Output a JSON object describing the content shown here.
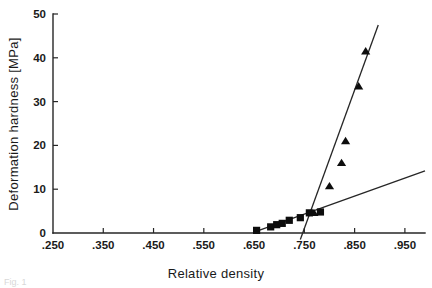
{
  "chart_data": {
    "type": "scatter",
    "title": "",
    "xlabel": "Relative density",
    "ylabel": "Deformation hardness [MPa]",
    "xlim": [
      0.25,
      0.99
    ],
    "ylim": [
      0,
      50
    ],
    "grid": false,
    "legend": "none",
    "xticks": [
      0.25,
      0.35,
      0.45,
      0.55,
      0.65,
      0.75,
      0.85,
      0.95
    ],
    "xticklabels": [
      ".250",
      ".350",
      ".450",
      ".550",
      ".650",
      ".750",
      ".850",
      ".950"
    ],
    "yticks": [
      0,
      10,
      20,
      30,
      40,
      50
    ],
    "yticklabels": [
      "0",
      "10",
      "20",
      "30",
      "40",
      "50"
    ],
    "series": [
      {
        "name": "square-series",
        "marker": "square",
        "x": [
          0.655,
          0.683,
          0.695,
          0.706,
          0.72,
          0.742,
          0.76,
          0.782
        ],
        "y": [
          0.6,
          1.4,
          1.9,
          2.2,
          2.9,
          3.5,
          4.6,
          4.8
        ]
      },
      {
        "name": "triangle-series",
        "marker": "triangle",
        "x": [
          0.769,
          0.8,
          0.824,
          0.832,
          0.858,
          0.872
        ],
        "y": [
          4.6,
          10.7,
          16.0,
          21.0,
          33.5,
          41.5
        ]
      }
    ],
    "fit_lines": [
      {
        "name": "shallow-fit",
        "x": [
          0.65,
          0.99
        ],
        "y": [
          0.2,
          14.2
        ]
      },
      {
        "name": "steep-fit",
        "x": [
          0.742,
          0.897
        ],
        "y": [
          -1.5,
          47.5
        ]
      }
    ]
  },
  "caption": {
    "ghost_text": "Fig. 1"
  }
}
